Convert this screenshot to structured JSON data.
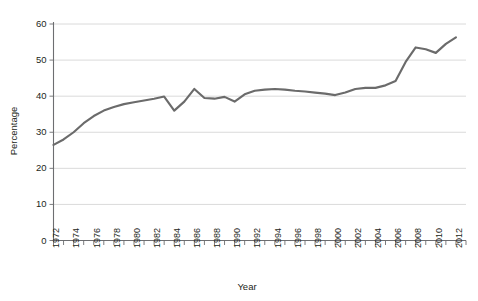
{
  "chart_data": {
    "type": "line",
    "title": "",
    "xlabel": "Year",
    "ylabel": "Percentage",
    "x": [
      1972,
      1973,
      1974,
      1975,
      1976,
      1977,
      1978,
      1979,
      1980,
      1981,
      1982,
      1983,
      1984,
      1985,
      1986,
      1987,
      1988,
      1989,
      1990,
      1991,
      1992,
      1993,
      1994,
      1995,
      1996,
      1997,
      1998,
      1999,
      2000,
      2001,
      2002,
      2003,
      2004,
      2005,
      2006,
      2007,
      2008,
      2009,
      2010,
      2011,
      2012
    ],
    "values": [
      26.5,
      28.0,
      30.0,
      32.5,
      34.5,
      36.0,
      37.0,
      37.8,
      38.3,
      38.8,
      39.3,
      39.9,
      36.0,
      38.5,
      42.0,
      39.5,
      39.3,
      39.8,
      38.5,
      40.5,
      41.5,
      41.8,
      42.0,
      41.8,
      41.5,
      41.3,
      41.0,
      40.7,
      40.3,
      41.0,
      42.0,
      42.3,
      42.3,
      43.0,
      44.2,
      49.5,
      53.5,
      53.0,
      52.0,
      54.5,
      56.3
    ],
    "xlim": [
      1972,
      2013
    ],
    "ylim": [
      0,
      60
    ],
    "yticks": [
      0,
      10,
      20,
      30,
      40,
      50,
      60
    ],
    "xtick_labels": [
      "1972",
      "1974",
      "1976",
      "1978",
      "1980",
      "1982",
      "1984",
      "1986",
      "1988",
      "1990",
      "1992",
      "1994",
      "1996",
      "1998",
      "2000",
      "2002",
      "2004",
      "2006",
      "2008",
      "2010",
      "2012"
    ],
    "xtick_values": [
      1972,
      1974,
      1976,
      1978,
      1980,
      1982,
      1984,
      1986,
      1988,
      1990,
      1992,
      1994,
      1996,
      1998,
      2000,
      2002,
      2004,
      2006,
      2008,
      2010,
      2012
    ],
    "grid": "horizontal",
    "legend": "none",
    "series_color": "#6b6b6b",
    "grid_color": "#d6d6d6",
    "axis_color": "#6d6e71",
    "background": "#ffffff"
  }
}
